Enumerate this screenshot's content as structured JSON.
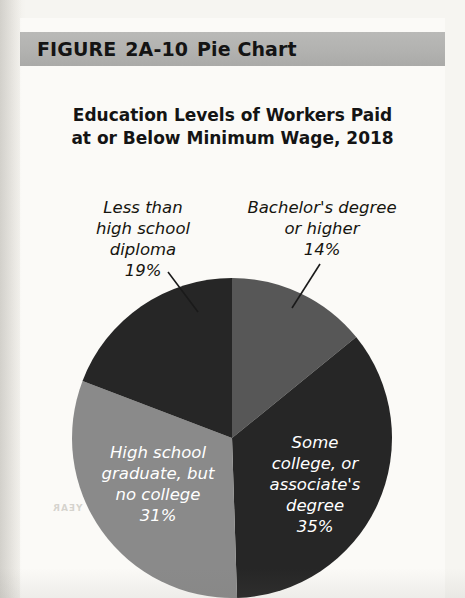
{
  "banner": {
    "figure_word": "FIGURE",
    "figure_number": "2A-10",
    "figure_title": "Pie Chart",
    "background_color": "#b2b2b0"
  },
  "chart_title": {
    "line1": "Education Levels of Workers Paid",
    "line2": "at or Below Minimum Wage, 2018"
  },
  "bleed_text": "YEAR",
  "chart_data": {
    "type": "pie",
    "title": "Education Levels of Workers Paid at or Below Minimum Wage, 2018",
    "start_angle_deg": 0,
    "direction": "clockwise",
    "units": "percent",
    "total": 99,
    "legend": "none",
    "labels_inline": true,
    "categories": [
      "Bachelor's degree or higher",
      "Some college, or associate's degree",
      "High school graduate, but no college",
      "Less than high school diploma"
    ],
    "values": [
      14,
      35,
      31,
      19
    ],
    "slices": [
      {
        "name": "Bachelor's degree or higher",
        "label_line1": "Bachelor's degree",
        "label_line2": "or higher",
        "value": 14,
        "value_label": "14%",
        "color": "#575757",
        "label_position": "outside",
        "label_color": "#16150f"
      },
      {
        "name": "Some college, or associate's degree",
        "label_line1": "Some",
        "label_line2": "college, or",
        "label_line3": "associate's",
        "label_line4": "degree",
        "value": 35,
        "value_label": "35%",
        "color": "#262626",
        "label_position": "inside",
        "label_color": "#ffffff"
      },
      {
        "name": "High school graduate, but no college",
        "label_line1": "High school",
        "label_line2": "graduate, but",
        "label_line3": "no college",
        "value": 31,
        "value_label": "31%",
        "color": "#8a8a8a",
        "label_position": "inside",
        "label_color": "#ffffff"
      },
      {
        "name": "Less than high school diploma",
        "label_line1": "Less than",
        "label_line2": "high school",
        "label_line3": "diploma",
        "value": 19,
        "value_label": "19%",
        "color": "#262626",
        "label_position": "outside",
        "label_color": "#16150f"
      }
    ]
  }
}
